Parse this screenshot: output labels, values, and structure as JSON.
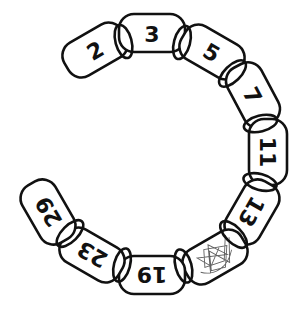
{
  "diagram": {
    "links": [
      {
        "label": "2",
        "cx": 95,
        "cy": 50,
        "angle": -30
      },
      {
        "label": "3",
        "cx": 152,
        "cy": 33,
        "angle": 0
      },
      {
        "label": "5",
        "cx": 212,
        "cy": 52,
        "angle": 30
      },
      {
        "label": "7",
        "cx": 253,
        "cy": 95,
        "angle": 62
      },
      {
        "label": "11",
        "cx": 268,
        "cy": 152,
        "angle": 90
      },
      {
        "label": "13",
        "cx": 252,
        "cy": 212,
        "angle": 120
      },
      {
        "label": "",
        "cx": 215,
        "cy": 257,
        "angle": 150,
        "scribbled": true
      },
      {
        "label": "19",
        "cx": 152,
        "cy": 275,
        "angle": 180
      },
      {
        "label": "23",
        "cx": 92,
        "cy": 255,
        "angle": 210
      },
      {
        "label": "29",
        "cx": 48,
        "cy": 212,
        "angle": 240
      }
    ],
    "colors": {
      "stroke": "#111111",
      "background": "#ffffff",
      "scribble": "#444444"
    }
  }
}
